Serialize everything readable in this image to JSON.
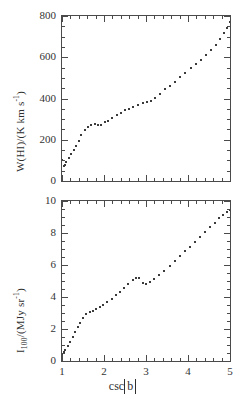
{
  "figure": {
    "background": "#ffffff",
    "ink_color": "#3b3b3b",
    "panels": [
      "top",
      "bottom"
    ]
  },
  "axis_titles": {
    "top_y_prefix": "W(HI)/(K km s",
    "top_y_exponent": "-1",
    "top_y_suffix": ")",
    "bottom_y_prefix": "I",
    "bottom_y_sub": "100",
    "bottom_y_mid": "/(MJy sr",
    "bottom_y_exponent": "-1",
    "bottom_y_suffix": ")",
    "x_prefix": "csc",
    "x_abs": "b"
  },
  "footer_text": "",
  "chart_data": [
    {
      "id": "top",
      "type": "scatter",
      "title": "",
      "xlabel": "csc|b|",
      "ylabel": "W(HI)/(K km s^-1)",
      "xlim": [
        1,
        5
      ],
      "ylim": [
        0,
        800
      ],
      "xticks": [
        1,
        2,
        3,
        4,
        5
      ],
      "yticks": [
        0,
        200,
        400,
        600,
        800
      ],
      "xminor_step": 0.2,
      "yminor_step": 50,
      "grid": false,
      "legend": "none",
      "tick_direction": "in",
      "x": [
        1.0,
        1.04,
        1.06,
        1.1,
        1.16,
        1.22,
        1.28,
        1.34,
        1.4,
        1.46,
        1.54,
        1.62,
        1.7,
        1.78,
        1.86,
        1.94,
        2.02,
        2.1,
        2.2,
        2.3,
        2.4,
        2.5,
        2.6,
        2.7,
        2.8,
        2.92,
        3.02,
        3.12,
        3.22,
        3.34,
        3.46,
        3.58,
        3.7,
        3.82,
        3.94,
        4.06,
        4.18,
        4.3,
        4.42,
        4.54,
        4.66,
        4.76,
        4.86,
        4.94,
        4.99
      ],
      "y": [
        100,
        72,
        78,
        92,
        112,
        130,
        150,
        170,
        196,
        222,
        248,
        262,
        272,
        276,
        270,
        272,
        284,
        292,
        306,
        318,
        330,
        342,
        350,
        360,
        368,
        378,
        384,
        388,
        404,
        424,
        444,
        462,
        482,
        502,
        522,
        546,
        566,
        588,
        610,
        634,
        660,
        690,
        718,
        742,
        772
      ]
    },
    {
      "id": "bottom",
      "type": "scatter",
      "title": "",
      "xlabel": "csc|b|",
      "ylabel": "I_100/(MJy sr^-1)",
      "xlim": [
        1,
        5
      ],
      "ylim": [
        0,
        10
      ],
      "xticks": [
        1,
        2,
        3,
        4,
        5
      ],
      "yticks": [
        0,
        2,
        4,
        6,
        8,
        10
      ],
      "xminor_step": 0.2,
      "yminor_step": 0.5,
      "grid": false,
      "legend": "none",
      "tick_direction": "in",
      "x": [
        1.0,
        1.04,
        1.08,
        1.14,
        1.2,
        1.26,
        1.32,
        1.38,
        1.44,
        1.5,
        1.58,
        1.66,
        1.74,
        1.82,
        1.9,
        1.98,
        2.08,
        2.18,
        2.28,
        2.38,
        2.48,
        2.58,
        2.68,
        2.76,
        2.84,
        2.92,
        3.0,
        3.1,
        3.2,
        3.32,
        3.44,
        3.56,
        3.68,
        3.8,
        3.92,
        4.04,
        4.16,
        4.28,
        4.4,
        4.52,
        4.64,
        4.74,
        4.84,
        4.92,
        4.99
      ],
      "y": [
        0.45,
        0.55,
        0.7,
        0.95,
        1.2,
        1.5,
        1.8,
        2.1,
        2.4,
        2.7,
        2.95,
        3.05,
        3.15,
        3.25,
        3.35,
        3.5,
        3.7,
        3.9,
        4.1,
        4.3,
        4.55,
        4.8,
        5.05,
        5.2,
        5.18,
        4.9,
        4.8,
        4.95,
        5.15,
        5.4,
        5.65,
        5.95,
        6.25,
        6.55,
        6.85,
        7.15,
        7.45,
        7.75,
        8.05,
        8.35,
        8.65,
        8.95,
        9.15,
        9.3,
        9.45
      ]
    }
  ]
}
